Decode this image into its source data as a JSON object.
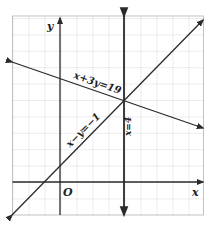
{
  "figure": {
    "axes": {
      "x_label": "x",
      "y_label": "y",
      "origin_label": "O"
    },
    "grid": {
      "x_min": -3,
      "x_max": 9,
      "y_min": -2,
      "y_max": 10,
      "unit_px": 16
    },
    "lines": [
      {
        "id": "line1",
        "equation": "x + 3y = 19",
        "label": "x+3y=19"
      },
      {
        "id": "line2",
        "equation": "x − y = −1",
        "label": "x−y=−1"
      },
      {
        "id": "line3",
        "equation": "x = 4",
        "label": "x=4"
      }
    ],
    "intersection": {
      "x": 4,
      "y": 5
    }
  },
  "colors": {
    "grid": "#9a9a9a",
    "line": "#2a2a2a",
    "background": "#ffffff"
  }
}
